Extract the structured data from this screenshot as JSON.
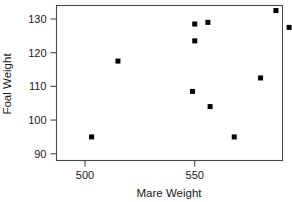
{
  "chart_data": {
    "type": "scatter",
    "title": "",
    "xlabel": "Mare Weight",
    "ylabel": "Foal Weight",
    "xlim": [
      487,
      590
    ],
    "ylim": [
      88,
      134
    ],
    "xticks": [
      500,
      550,
      600,
      650
    ],
    "yticks": [
      90,
      100,
      110,
      120,
      130
    ],
    "xtick_labels": [
      "500",
      "550",
      "600",
      "650"
    ],
    "ytick_labels": [
      "90",
      "100",
      "110",
      "120",
      "130"
    ],
    "grid": false,
    "legend": false,
    "marker": "square",
    "marker_color": "#000000",
    "frame_color": "#4a4a4a",
    "points": [
      {
        "x": 503,
        "y": 95.0
      },
      {
        "x": 515,
        "y": 117.5
      },
      {
        "x": 549,
        "y": 108.5
      },
      {
        "x": 550,
        "y": 123.5
      },
      {
        "x": 550,
        "y": 128.5
      },
      {
        "x": 556,
        "y": 129.0
      },
      {
        "x": 557,
        "y": 104.0
      },
      {
        "x": 568,
        "y": 95.0
      },
      {
        "x": 580,
        "y": 112.5
      },
      {
        "x": 587,
        "y": 132.5
      },
      {
        "x": 593,
        "y": 127.5
      },
      {
        "x": 615,
        "y": 93.5
      },
      {
        "x": 637,
        "y": 119.5
      },
      {
        "x": 642,
        "y": 113.5
      },
      {
        "x": 642,
        "y": 104.0
      }
    ],
    "x_values": [
      503,
      515,
      549,
      550,
      550,
      556,
      557,
      568,
      580,
      587,
      593,
      615,
      637,
      642,
      642
    ],
    "y_values": [
      95.0,
      117.5,
      108.5,
      123.5,
      128.5,
      129.0,
      104.0,
      95.0,
      112.5,
      132.5,
      127.5,
      93.5,
      119.5,
      113.5,
      104.0
    ]
  }
}
